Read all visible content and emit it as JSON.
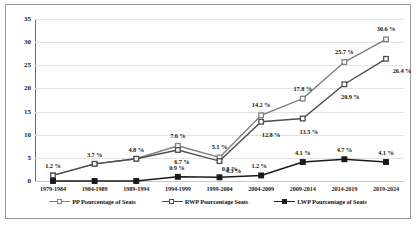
{
  "chart_data": {
    "type": "line",
    "title": "",
    "xlabel": "",
    "ylabel": "",
    "ylim": [
      0,
      35
    ],
    "yticks": [
      0,
      5,
      10,
      15,
      20,
      25,
      30,
      35
    ],
    "grid": true,
    "legend_position": "bottom",
    "categories": [
      "1979-1984",
      "1984-1989",
      "1989-1994",
      "1994-1999",
      "1999-2004",
      "2004-2009",
      "2009-2014",
      "2014-2019",
      "2019-2024"
    ],
    "series": [
      {
        "name": "PP Pourcentage of Seats",
        "color": "#808080",
        "marker": "square",
        "values": [
          1.2,
          3.7,
          4.8,
          7.6,
          5.1,
          14.2,
          17.8,
          25.7,
          30.6
        ],
        "labels": [
          "1.2 %",
          "3.7 %",
          "4.8 %",
          "7.6 %",
          "5.1 %",
          "14.2 %",
          "17.8 %",
          "25.7 %",
          "30.6 %"
        ]
      },
      {
        "name": "RWP Pourcentage Seats",
        "color": "#4d4d4d",
        "marker": "square",
        "values": [
          1.2,
          3.7,
          4.8,
          6.7,
          4.3,
          12.8,
          13.5,
          20.9,
          26.4
        ],
        "labels": [
          "",
          "",
          "",
          "6.7 %",
          "4.3 %",
          "12.8 %",
          "13.5 %",
          "20.9 %",
          "26.4 %"
        ]
      },
      {
        "name": "LWP Pourcentage of Seats",
        "color": "#1a1a1a",
        "marker": "square",
        "values": [
          0.0,
          0.0,
          0.0,
          0.9,
          0.8,
          1.2,
          4.1,
          4.7,
          4.1
        ],
        "labels": [
          "",
          "",
          "",
          "0.9 %",
          "0.8 %",
          "1.2 %",
          "4.1 %",
          "4.7 %",
          "4.1 %"
        ]
      }
    ],
    "label_offsets": [
      [
        [
          0,
          -10
        ],
        [
          0,
          -10
        ],
        [
          0,
          -10
        ],
        [
          0,
          -11
        ],
        [
          0,
          -11
        ],
        [
          0,
          -11
        ],
        [
          0,
          -11
        ],
        [
          0,
          -11
        ],
        [
          0,
          -11
        ]
      ],
      [
        [
          0,
          0
        ],
        [
          0,
          0
        ],
        [
          0,
          0
        ],
        [
          4,
          11
        ],
        [
          14,
          9
        ],
        [
          10,
          12
        ],
        [
          6,
          12
        ],
        [
          6,
          12
        ],
        [
          16,
          11
        ]
      ],
      [
        [
          0,
          0
        ],
        [
          0,
          0
        ],
        [
          0,
          0
        ],
        [
          -1,
          -10
        ],
        [
          10,
          -9
        ],
        [
          -2,
          -10
        ],
        [
          0,
          -10
        ],
        [
          0,
          -10
        ],
        [
          0,
          -10
        ]
      ]
    ]
  }
}
